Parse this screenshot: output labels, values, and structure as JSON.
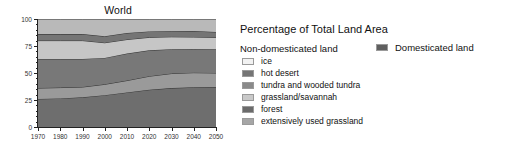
{
  "chart_data": {
    "type": "area",
    "title": "World",
    "xlabel": "",
    "ylabel": "",
    "xlim": [
      1970,
      2050
    ],
    "ylim": [
      0,
      100
    ],
    "grid": false,
    "legend_position": "right",
    "x": [
      1970,
      1980,
      1990,
      2000,
      2010,
      2020,
      2030,
      2040,
      2050
    ],
    "ticks": {
      "y_major": [
        0,
        25,
        50,
        75,
        100
      ],
      "y_minor": [
        5,
        10,
        15,
        20,
        30,
        35,
        40,
        45,
        55,
        60,
        65,
        70,
        80,
        85,
        90,
        95
      ],
      "x_major": [
        1970,
        1980,
        1990,
        2000,
        2010,
        2020,
        2030,
        2040,
        2050
      ]
    },
    "stack_order_bottom_to_top": [
      "forest",
      "extensively used grassland",
      "grassland/savannah",
      "tundra and wooded tundra",
      "hot desert",
      "ice"
    ],
    "series": [
      {
        "name": "forest",
        "color": "#6e6e6e",
        "values": [
          26,
          26.5,
          27.5,
          29.5,
          32,
          34.5,
          36,
          36.8,
          37
        ]
      },
      {
        "name": "extensively used grassland",
        "color": "#9a9a9a",
        "values": [
          10,
          10,
          9.5,
          10,
          11,
          12.5,
          13.5,
          13.5,
          13
        ]
      },
      {
        "name": "grassland/savannah",
        "color": "#787878",
        "values": [
          27,
          26.5,
          26,
          24.5,
          25,
          24,
          22.5,
          22,
          22
        ]
      },
      {
        "name": "tundra and wooded tundra",
        "color": "#c6c6c6",
        "values": [
          17,
          17,
          17,
          14,
          13,
          12,
          11.5,
          11,
          11
        ]
      },
      {
        "name": "hot desert",
        "color": "#757575",
        "values": [
          6,
          6,
          6,
          6,
          6,
          5.5,
          5.5,
          5.5,
          5
        ]
      },
      {
        "name": "ice",
        "color": "#b9b9b9",
        "values": [
          14,
          14,
          14,
          16,
          13,
          11.5,
          11,
          11.2,
          12
        ]
      }
    ],
    "cumulative_boundaries": {
      "1970": [
        26,
        36,
        63,
        80,
        86,
        100
      ],
      "2050": [
        37,
        50,
        72,
        83,
        88,
        100
      ]
    }
  },
  "chart": {
    "title": "World",
    "y_labels": [
      "0",
      "25",
      "50",
      "75",
      "100"
    ],
    "x_labels": [
      "1970",
      "1980",
      "1990",
      "2000",
      "2010",
      "2020",
      "2030",
      "2040",
      "2050"
    ]
  },
  "legend": {
    "heading": "Percentage of Total Land Area",
    "non_domesticated_label": "Non-domesticated land",
    "domesticated_label": "Domesticated land",
    "domesticated_color": "#5f5f5f",
    "items": [
      {
        "label": "ice",
        "color": "#f2f2f2"
      },
      {
        "label": "hot desert",
        "color": "#757575"
      },
      {
        "label": "tundra and wooded tundra",
        "color": "#8a8a8a"
      },
      {
        "label": "grassland/savannah",
        "color": "#c9c9c9"
      },
      {
        "label": "forest",
        "color": "#6b6b6b"
      },
      {
        "label": "extensively used grassland",
        "color": "#a6a6a6"
      }
    ]
  }
}
